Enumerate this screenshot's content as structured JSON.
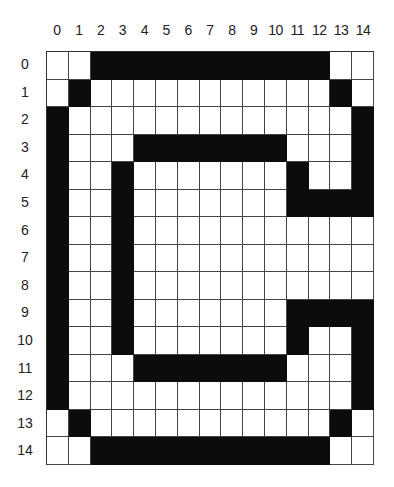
{
  "diagram": {
    "columns": [
      "0",
      "1",
      "2",
      "3",
      "4",
      "5",
      "6",
      "7",
      "8",
      "9",
      "10",
      "11",
      "12",
      "13",
      "14"
    ],
    "rows": [
      "0",
      "1",
      "2",
      "3",
      "4",
      "5",
      "6",
      "7",
      "8",
      "9",
      "10",
      "11",
      "12",
      "13",
      "14"
    ],
    "colors": {
      "filled": "#0c0c0c",
      "empty": "#ffffff",
      "gridline": "#444444"
    },
    "bitmap": [
      "..XXXXXXXXXXX..",
      ".X...........X.",
      "X.............X",
      "X...XXXXXXX...X",
      "X..X.......X..X",
      "X..X.......XXXX",
      "X..X...........",
      "X..X...........",
      "X..X...........",
      "X..X.......XXXX",
      "X..X.......X..X",
      "X...XXXXXXX...X",
      "X.............X",
      ".X...........X.",
      "..XXXXXXXXXXX.."
    ]
  }
}
